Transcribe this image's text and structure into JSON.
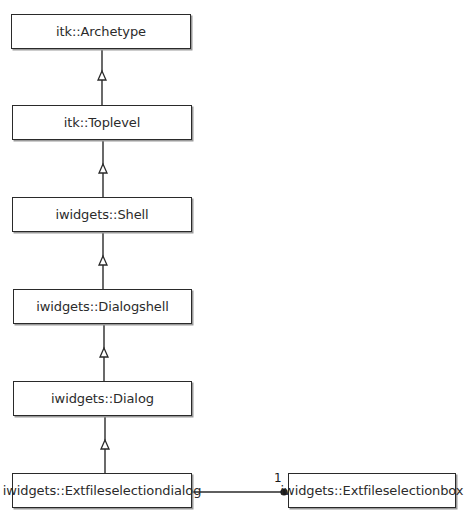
{
  "diagram": {
    "type": "uml-class-hierarchy",
    "colors": {
      "line": "#2a2a2a",
      "box_fill": "#ffffff",
      "box_border": "#2a2a2a",
      "text": "#2b2b2b"
    },
    "classes": [
      {
        "id": "archetype",
        "label": "itk::Archetype"
      },
      {
        "id": "toplevel",
        "label": "itk::Toplevel"
      },
      {
        "id": "shell",
        "label": "iwidgets::Shell"
      },
      {
        "id": "dialogshell",
        "label": "iwidgets::Dialogshell"
      },
      {
        "id": "dialog",
        "label": "iwidgets::Dialog"
      },
      {
        "id": "extfileselectiondialog",
        "label": "iwidgets::Extfileselectiondialog"
      },
      {
        "id": "extfileselectionbox",
        "label": "iwidgets::Extfileselectionbox"
      }
    ],
    "relationships": [
      {
        "type": "generalization",
        "from": "toplevel",
        "to": "archetype"
      },
      {
        "type": "generalization",
        "from": "shell",
        "to": "toplevel"
      },
      {
        "type": "generalization",
        "from": "dialogshell",
        "to": "shell"
      },
      {
        "type": "generalization",
        "from": "dialog",
        "to": "dialogshell"
      },
      {
        "type": "generalization",
        "from": "extfileselectiondialog",
        "to": "dialog"
      },
      {
        "type": "composition",
        "from": "extfileselectiondialog",
        "to": "extfileselectionbox",
        "multiplicity": "1"
      }
    ]
  }
}
